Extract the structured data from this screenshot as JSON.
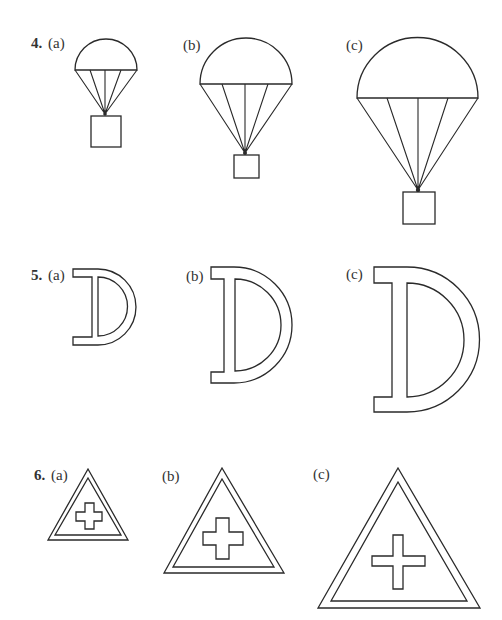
{
  "problems": [
    {
      "number": "4.",
      "figure": "parachute",
      "parts": [
        {
          "label": "(a)",
          "scale": "small"
        },
        {
          "label": "(b)",
          "scale": "medium"
        },
        {
          "label": "(c)",
          "scale": "large"
        }
      ]
    },
    {
      "number": "5.",
      "figure": "letter-D-outline",
      "parts": [
        {
          "label": "(a)",
          "scale": "small"
        },
        {
          "label": "(b)",
          "scale": "medium"
        },
        {
          "label": "(c)",
          "scale": "large"
        }
      ]
    },
    {
      "number": "6.",
      "figure": "triangle-with-cross",
      "parts": [
        {
          "label": "(a)",
          "scale": "small"
        },
        {
          "label": "(b)",
          "scale": "medium"
        },
        {
          "label": "(c)",
          "scale": "large"
        }
      ]
    }
  ],
  "colors": {
    "ink": "#2a2a2a",
    "paper": "#ffffff"
  }
}
